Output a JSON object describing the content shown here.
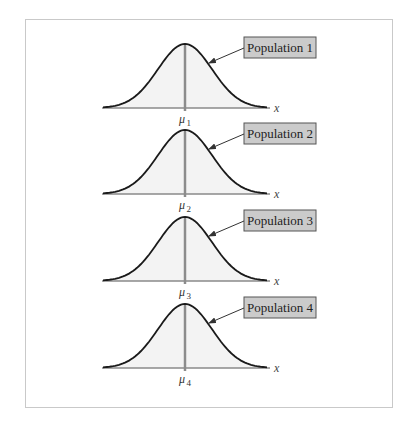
{
  "figure": {
    "axis_label": "x",
    "mean_symbol": "μ",
    "colors": {
      "frame_border": "#c9c9c9",
      "curve": "#1a1a1a",
      "curve_fill": "#f3f3f3",
      "axis": "#8a8a8a",
      "mean_line": "#8c8c8c",
      "label_box_fill": "#cbcbcb",
      "label_box_border": "#555555"
    },
    "panels": [
      {
        "label": "Population 1",
        "mean_label_sub": "1"
      },
      {
        "label": "Population 2",
        "mean_label_sub": "2"
      },
      {
        "label": "Population 3",
        "mean_label_sub": "3"
      },
      {
        "label": "Population 4",
        "mean_label_sub": "4"
      }
    ]
  },
  "chart_data": {
    "type": "line",
    "title": "",
    "xlabel": "x",
    "ylabel": "",
    "series": [
      {
        "name": "Population 1",
        "mean": "μ1",
        "shape": "normal"
      },
      {
        "name": "Population 2",
        "mean": "μ2",
        "shape": "normal"
      },
      {
        "name": "Population 3",
        "mean": "μ3",
        "shape": "normal"
      },
      {
        "name": "Population 4",
        "mean": "μ4",
        "shape": "normal"
      }
    ],
    "grid": false,
    "legend_position": "callout boxes to the right of each curve"
  }
}
